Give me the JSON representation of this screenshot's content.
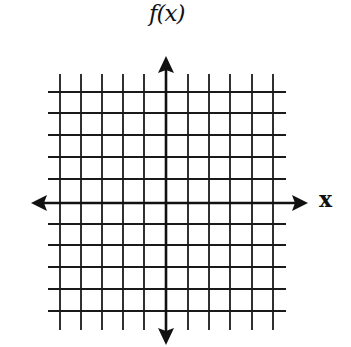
{
  "diagram": {
    "type": "coordinate-grid",
    "y_axis_label": "f(x)",
    "x_axis_label": "x",
    "grid": {
      "vertical_lines_each_side": 5,
      "horizontal_lines_each_side": 5,
      "line_color": "#1a1a1a"
    },
    "axes": {
      "arrows": [
        "left",
        "right",
        "up",
        "down"
      ],
      "color": "#111111"
    }
  }
}
